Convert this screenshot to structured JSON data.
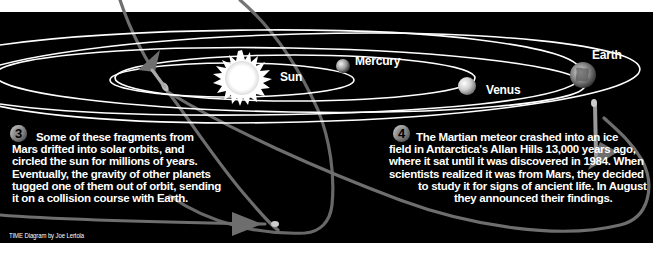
{
  "colors": {
    "background": "#000000",
    "page": "#ffffff",
    "orbit": "#ffffff",
    "meteor_path": "#6e6e6e",
    "text": "#ffffff",
    "step_badge": "#8a8a8a"
  },
  "bodies": [
    {
      "name": "Sun",
      "label": "Sun",
      "icon": "sun-icon"
    },
    {
      "name": "Mercury",
      "label": "Mercury",
      "icon": "planet-icon"
    },
    {
      "name": "Venus",
      "label": "Venus",
      "icon": "planet-icon"
    },
    {
      "name": "Earth",
      "label": "Earth",
      "icon": "earth-icon"
    }
  ],
  "steps": [
    {
      "number": "3",
      "lines": [
        "Some of these fragments from",
        "Mars drifted into solar orbits, and",
        "circled the sun for millions of years.",
        "Eventually, the gravity of other planets",
        "tugged one of them out of orbit, sending",
        "it on a collision course with Earth."
      ]
    },
    {
      "number": "4",
      "lines": [
        "The Martian meteor crashed into an ice",
        "field in Antarctica's Allan Hills 13,000 years ago,",
        "where it sat until it was discovered in 1984. When",
        "scientists realized it was from Mars, they decided",
        "to study it for signs of ancient life. In August",
        "they announced their findings."
      ]
    }
  ],
  "credit": "TIME Diagram by Joe Lertola"
}
